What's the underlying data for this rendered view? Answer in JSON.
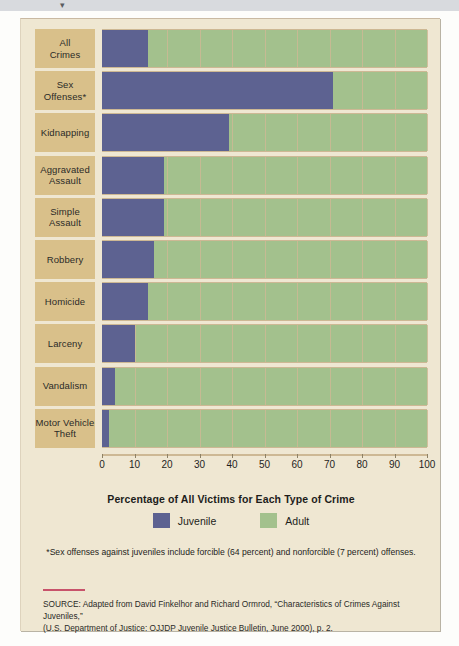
{
  "top_strip": {
    "glyph": "▾"
  },
  "chart_data": {
    "type": "bar",
    "orientation": "horizontal",
    "stacked": true,
    "title": "",
    "xlabel": "Percentage of All Victims for Each Type of Crime",
    "ylabel": "",
    "xlim": [
      0,
      100
    ],
    "xticks": [
      0,
      10,
      20,
      30,
      40,
      50,
      60,
      70,
      80,
      90,
      100
    ],
    "grid": true,
    "legend_position": "bottom",
    "categories": [
      "All\nCrimes",
      "Sex\nOffenses*",
      "Kidnapping",
      "Aggravated\nAssault",
      "Simple\nAssault",
      "Robbery",
      "Homicide",
      "Larceny",
      "Vandalism",
      "Motor Vehicle\nTheft"
    ],
    "series": [
      {
        "name": "Juvenile",
        "color": "#5d6291",
        "values": [
          14,
          71,
          39,
          19,
          19,
          16,
          14,
          10,
          4,
          2
        ]
      },
      {
        "name": "Adult",
        "color": "#a3c18d",
        "values": [
          86,
          29,
          61,
          81,
          81,
          84,
          86,
          90,
          96,
          98
        ]
      }
    ]
  },
  "rows": [
    {
      "label_line1": "All",
      "label_line2": "Crimes",
      "juvenile": 14
    },
    {
      "label_line1": "Sex",
      "label_line2": "Offenses*",
      "juvenile": 71
    },
    {
      "label_line1": "Kidnapping",
      "label_line2": "",
      "juvenile": 39
    },
    {
      "label_line1": "Aggravated",
      "label_line2": "Assault",
      "juvenile": 19
    },
    {
      "label_line1": "Simple",
      "label_line2": "Assault",
      "juvenile": 19
    },
    {
      "label_line1": "Robbery",
      "label_line2": "",
      "juvenile": 16
    },
    {
      "label_line1": "Homicide",
      "label_line2": "",
      "juvenile": 14
    },
    {
      "label_line1": "Larceny",
      "label_line2": "",
      "juvenile": 10
    },
    {
      "label_line1": "Vandalism",
      "label_line2": "",
      "juvenile": 4
    },
    {
      "label_line1": "Motor Vehicle",
      "label_line2": "Theft",
      "juvenile": 2
    }
  ],
  "axis": {
    "ticks": [
      "0",
      "10",
      "20",
      "30",
      "40",
      "50",
      "60",
      "70",
      "80",
      "90",
      "100"
    ],
    "title": "Percentage of All Victims for Each Type of Crime"
  },
  "legend": [
    {
      "label": "Juvenile",
      "color": "#5d6291"
    },
    {
      "label": "Adult",
      "color": "#a3c18d"
    }
  ],
  "footnote": "*Sex offenses against juveniles include forcible (64 percent) and nonforcible (7 percent) offenses.",
  "source": {
    "line1": "SOURCE: Adapted from David Finkelhor and Richard Ormrod, “Characteristics of Crimes Against Juveniles,”",
    "line2": "(U.S. Department of Justice: OJJDP Juvenile Justice Bulletin, June 2000), p. 2."
  },
  "colors": {
    "juvenile": "#5d6291",
    "adult": "#a3c18d",
    "label_block": "#d9c08a",
    "panel": "#efe7d2",
    "rule": "#c8536b"
  }
}
